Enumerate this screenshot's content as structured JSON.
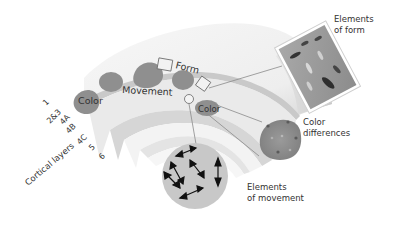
{
  "diagram": {
    "region_labels": {
      "color_left": "Color",
      "movement": "Movement",
      "form": "Form",
      "color_right": "Color"
    },
    "layers": {
      "axis_label": "Cortical layers",
      "items": [
        "1",
        "2&3",
        "4A",
        "4B",
        "4C",
        "5",
        "6"
      ]
    },
    "callouts": {
      "form": {
        "line1": "Elements",
        "line2": "of form"
      },
      "color": {
        "line1": "Color",
        "line2": "differences"
      },
      "movement": {
        "line1": "Elements",
        "line2": "of movement"
      }
    },
    "colors": {
      "blob": "#8f8f8f",
      "slab_top": "#ececec",
      "slab_band": "#d4d4d4",
      "layer_light": "#f2f2f2",
      "callout_line": "#8a8a8a",
      "movement_disc": "#c8c8c8",
      "color_disc": "#8a8a8a",
      "form_patch": "#9a9a9a",
      "text": "#333333"
    }
  }
}
